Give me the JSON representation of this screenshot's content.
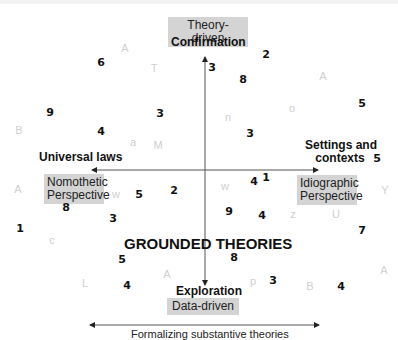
{
  "diagram": {
    "title": "GROUNDED THEORIES",
    "vertical_axis": {
      "top_box": "Theory-driven",
      "top_label": "Confirmation",
      "bottom_label": "Exploration",
      "bottom_box": "Data-driven"
    },
    "horizontal_axis": {
      "left_label": "Universal laws",
      "left_box_line1": "Nomothetic",
      "left_box_line2": "Perspective",
      "right_label_line1": "Settings and",
      "right_label_line2": "contexts",
      "right_box_line1": "Idiographic",
      "right_box_line2": "Perspective"
    },
    "bottom_arrow_caption": "Formalizing substantive theories",
    "scattered_numbers": [
      "6",
      "2",
      "3",
      "8",
      "9",
      "3",
      "5",
      "4",
      "3",
      "5",
      "5",
      "2",
      "4",
      "1",
      "8",
      "3",
      "9",
      "4",
      "1",
      "7",
      "8",
      "5",
      "4",
      "3",
      "4"
    ],
    "scattered_letters": [
      "A",
      "T",
      "A",
      "o",
      "B",
      "n",
      "a",
      "M",
      "A",
      "w",
      "w",
      "z",
      "U",
      "Y",
      "c",
      "A",
      "L",
      "A",
      "p",
      "B"
    ]
  }
}
